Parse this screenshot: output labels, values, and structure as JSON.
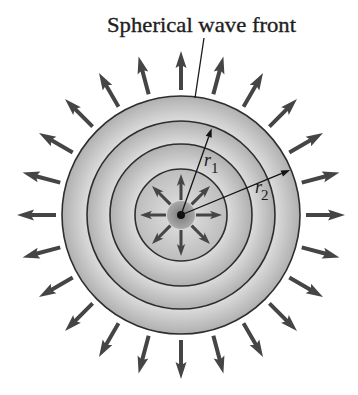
{
  "figure": {
    "title": "Spherical wave front",
    "labels": {
      "r1": {
        "base": "r",
        "sub": "1"
      },
      "r2": {
        "base": "r",
        "sub": "2"
      }
    }
  },
  "diagram": {
    "center": [
      181,
      215
    ],
    "wavefront_radii": [
      119,
      94,
      71,
      46
    ],
    "source_disk_radius": 14,
    "source_dot_radius": 4,
    "outer_arrows": {
      "count": 24,
      "angle_step_deg": 15,
      "r_start": 125,
      "r_end": 164,
      "head_length": 15,
      "head_half_width": 5.5,
      "shaft_half_width": 2
    },
    "inner_arrows": {
      "count": 8,
      "angle_step_deg": 45,
      "r_start": 15,
      "r_end": 41,
      "head_length": 10,
      "head_half_width": 4.2,
      "shaft_half_width": 1.5
    },
    "radius_vectors": [
      {
        "name": "r1",
        "angle_deg": 70.5,
        "length": 92
      },
      {
        "name": "r2",
        "angle_deg": 22.4,
        "length": 118
      }
    ],
    "leader_line": {
      "from": [
        204,
        38
      ],
      "to": [
        195,
        98
      ]
    },
    "colors": {
      "arrow": "#454545",
      "wavefront_line": "#2e2e2e",
      "band_light": "#dcdcdc",
      "band_dark": "#b0b0b0",
      "inner_light": "#d8d8d8",
      "inner_dark": "#bdbdbd",
      "source_disk_center": "#888888",
      "source_disk_edge": "#a9a9a9",
      "source_dot": "#101010",
      "vector_line": "#141414"
    }
  }
}
